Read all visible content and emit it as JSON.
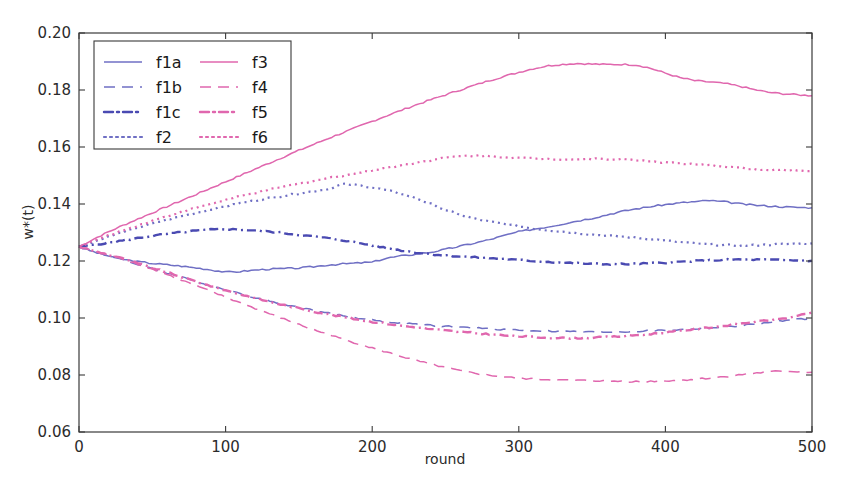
{
  "chart_data": {
    "type": "line",
    "title": "",
    "xlabel": "round",
    "ylabel": "w*(t)",
    "xlim": [
      0,
      500
    ],
    "ylim": [
      0.06,
      0.2
    ],
    "grid": false,
    "legend_position": "upper-left",
    "xticks": [
      "0",
      "100",
      "200",
      "300",
      "400",
      "500"
    ],
    "xtick_values": [
      0,
      100,
      200,
      300,
      400,
      500
    ],
    "yticks": [
      "0.06",
      "0.08",
      "0.10",
      "0.12",
      "0.14",
      "0.16",
      "0.18",
      "0.20"
    ],
    "ytick_values": [
      0.06,
      0.08,
      0.1,
      0.12,
      0.14,
      0.16,
      0.18,
      0.2
    ],
    "colors": {
      "blue": "#6f6fc4",
      "magenta": "#e067ae",
      "axis": "#3a3a3a",
      "background": "#ffffff"
    },
    "x": [
      0,
      10,
      20,
      30,
      40,
      50,
      60,
      70,
      80,
      90,
      100,
      110,
      120,
      130,
      140,
      150,
      160,
      170,
      180,
      190,
      200,
      210,
      220,
      230,
      240,
      250,
      260,
      270,
      280,
      290,
      300,
      310,
      320,
      330,
      340,
      350,
      360,
      370,
      380,
      390,
      400,
      410,
      420,
      430,
      440,
      450,
      460,
      470,
      480,
      490,
      500
    ],
    "series": [
      {
        "name": "f1a",
        "color": "#6f6fc4",
        "style": "solid",
        "dash": "none",
        "values": [
          0.125,
          0.1232,
          0.1218,
          0.1206,
          0.1198,
          0.1192,
          0.1187,
          0.1182,
          0.1176,
          0.1169,
          0.1161,
          0.1163,
          0.1168,
          0.1172,
          0.1173,
          0.1175,
          0.118,
          0.1186,
          0.119,
          0.1193,
          0.1196,
          0.121,
          0.1218,
          0.1224,
          0.1231,
          0.1241,
          0.1252,
          0.1263,
          0.1275,
          0.1289,
          0.1303,
          0.1312,
          0.132,
          0.133,
          0.1341,
          0.135,
          0.1362,
          0.1374,
          0.1383,
          0.1391,
          0.1398,
          0.1404,
          0.1408,
          0.1412,
          0.1408,
          0.1401,
          0.1396,
          0.1393,
          0.139,
          0.1388,
          0.1387
        ]
      },
      {
        "name": "f1b",
        "color": "#6f6fc4",
        "style": "dashed",
        "dash": "11,7",
        "values": [
          0.125,
          0.1234,
          0.1218,
          0.1204,
          0.1188,
          0.1173,
          0.1158,
          0.1143,
          0.1128,
          0.1113,
          0.11,
          0.1085,
          0.1072,
          0.106,
          0.1048,
          0.1037,
          0.1027,
          0.1017,
          0.1008,
          0.1,
          0.0993,
          0.0987,
          0.0982,
          0.0978,
          0.0974,
          0.0971,
          0.0968,
          0.0965,
          0.0962,
          0.096,
          0.0958,
          0.0956,
          0.0954,
          0.0953,
          0.0952,
          0.0951,
          0.0951,
          0.0952,
          0.0953,
          0.0955,
          0.0957,
          0.0959,
          0.0962,
          0.0965,
          0.0968,
          0.0972,
          0.0978,
          0.0984,
          0.099,
          0.0995,
          0.0999
        ]
      },
      {
        "name": "f1c",
        "color": "#4a4ab2",
        "style": "dashdot",
        "dash": "9,4,2,4",
        "values": [
          0.125,
          0.1257,
          0.1264,
          0.1272,
          0.128,
          0.1288,
          0.1295,
          0.1301,
          0.1306,
          0.131,
          0.1312,
          0.131,
          0.1307,
          0.1303,
          0.1298,
          0.1292,
          0.1286,
          0.128,
          0.1273,
          0.1264,
          0.1255,
          0.1245,
          0.1237,
          0.123,
          0.1224,
          0.122,
          0.1216,
          0.1213,
          0.121,
          0.1207,
          0.1203,
          0.12,
          0.1197,
          0.1194,
          0.1192,
          0.119,
          0.1189,
          0.1189,
          0.119,
          0.1192,
          0.1194,
          0.1197,
          0.12,
          0.1202,
          0.1204,
          0.1205,
          0.1205,
          0.1204,
          0.1203,
          0.1202,
          0.1201
        ]
      },
      {
        "name": "f2",
        "color": "#6f6fc4",
        "style": "dotted",
        "dash": "2,4",
        "values": [
          0.125,
          0.1268,
          0.1285,
          0.1301,
          0.1317,
          0.1331,
          0.1345,
          0.1357,
          0.1369,
          0.1381,
          0.1392,
          0.1403,
          0.1412,
          0.1421,
          0.1429,
          0.1437,
          0.1445,
          0.1452,
          0.147,
          0.1466,
          0.1458,
          0.1448,
          0.1436,
          0.142,
          0.14,
          0.1379,
          0.1362,
          0.1348,
          0.1338,
          0.133,
          0.1322,
          0.1314,
          0.1308,
          0.1303,
          0.1298,
          0.1293,
          0.1289,
          0.1286,
          0.1282,
          0.1277,
          0.1272,
          0.1266,
          0.1262,
          0.1258,
          0.1256,
          0.1254,
          0.1255,
          0.1257,
          0.1259,
          0.1261,
          0.1262
        ]
      },
      {
        "name": "f3",
        "color": "#e067ae",
        "style": "solid",
        "dash": "none",
        "values": [
          0.125,
          0.1277,
          0.1302,
          0.1325,
          0.1347,
          0.1369,
          0.1391,
          0.1412,
          0.1434,
          0.1456,
          0.1478,
          0.15,
          0.1522,
          0.1544,
          0.1566,
          0.1588,
          0.1609,
          0.163,
          0.165,
          0.167,
          0.169,
          0.171,
          0.1729,
          0.1748,
          0.1766,
          0.1783,
          0.18,
          0.1817,
          0.1833,
          0.1848,
          0.1862,
          0.1875,
          0.1885,
          0.189,
          0.1893,
          0.1891,
          0.1889,
          0.189,
          0.1888,
          0.1876,
          0.1859,
          0.1843,
          0.1833,
          0.1828,
          0.1823,
          0.1814,
          0.1802,
          0.1792,
          0.1787,
          0.1783,
          0.178
        ]
      },
      {
        "name": "f4",
        "color": "#e067ae",
        "style": "dashed",
        "dash": "11,7",
        "values": [
          0.125,
          0.1235,
          0.1221,
          0.1207,
          0.119,
          0.1172,
          0.1153,
          0.1133,
          0.1113,
          0.1093,
          0.1073,
          0.1053,
          0.1034,
          0.1015,
          0.0996,
          0.0977,
          0.0959,
          0.0942,
          0.0926,
          0.091,
          0.0895,
          0.088,
          0.0865,
          0.0851,
          0.0838,
          0.0826,
          0.0815,
          0.0806,
          0.0799,
          0.0793,
          0.0789,
          0.0786,
          0.0784,
          0.0782,
          0.0781,
          0.078,
          0.0779,
          0.0778,
          0.0777,
          0.0778,
          0.078,
          0.0782,
          0.0785,
          0.0789,
          0.0794,
          0.08,
          0.0806,
          0.0811,
          0.0814,
          0.0812,
          0.081
        ]
      },
      {
        "name": "f5",
        "color": "#e067ae",
        "style": "dashdot",
        "dash": "9,4,2,4",
        "values": [
          0.125,
          0.1236,
          0.1222,
          0.1208,
          0.1192,
          0.1176,
          0.116,
          0.1144,
          0.1128,
          0.1112,
          0.1097,
          0.1083,
          0.107,
          0.1057,
          0.1045,
          0.1034,
          0.1023,
          0.1013,
          0.1004,
          0.0995,
          0.0987,
          0.098,
          0.0973,
          0.0967,
          0.0961,
          0.0956,
          0.0951,
          0.0947,
          0.0943,
          0.0939,
          0.0936,
          0.0933,
          0.0931,
          0.093,
          0.093,
          0.0931,
          0.0933,
          0.0936,
          0.094,
          0.0944,
          0.0949,
          0.0955,
          0.0961,
          0.0967,
          0.0973,
          0.0979,
          0.0986,
          0.0992,
          0.0998,
          0.1006,
          0.102
        ]
      },
      {
        "name": "f6",
        "color": "#e067ae",
        "style": "dotted",
        "dash": "2,4",
        "values": [
          0.125,
          0.127,
          0.1289,
          0.1307,
          0.1324,
          0.1341,
          0.1357,
          0.1372,
          0.1387,
          0.1401,
          0.1414,
          0.1427,
          0.1439,
          0.145,
          0.1461,
          0.1471,
          0.1481,
          0.1491,
          0.15,
          0.1509,
          0.1518,
          0.1527,
          0.1536,
          0.1545,
          0.1554,
          0.1562,
          0.1568,
          0.157,
          0.1568,
          0.1565,
          0.1562,
          0.156,
          0.1558,
          0.1557,
          0.1557,
          0.1558,
          0.1558,
          0.1557,
          0.1554,
          0.155,
          0.1546,
          0.1542,
          0.1538,
          0.1535,
          0.1532,
          0.1528,
          0.1522,
          0.1518,
          0.152,
          0.1518,
          0.1516
        ]
      }
    ]
  },
  "legend": {
    "entries": [
      {
        "label": "f1a",
        "column": 0,
        "row": 0
      },
      {
        "label": "f1b",
        "column": 0,
        "row": 1
      },
      {
        "label": "f1c",
        "column": 0,
        "row": 2
      },
      {
        "label": "f2",
        "column": 0,
        "row": 3
      },
      {
        "label": "f3",
        "column": 1,
        "row": 0
      },
      {
        "label": "f4",
        "column": 1,
        "row": 1
      },
      {
        "label": "f5",
        "column": 1,
        "row": 2
      },
      {
        "label": "f6",
        "column": 1,
        "row": 3
      }
    ]
  }
}
